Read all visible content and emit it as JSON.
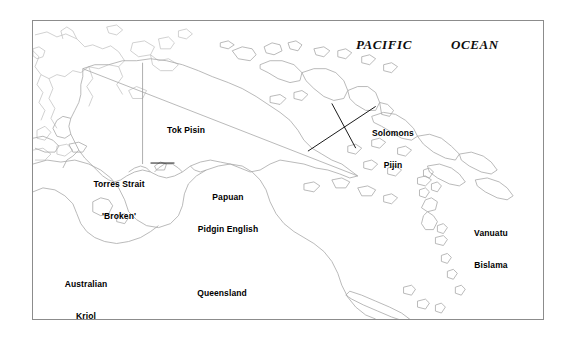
{
  "figure": {
    "kind": "reference-map",
    "frame_border_color": "#8c8c8c",
    "background_color": "#ffffff",
    "coastline_color": "#a8a8a8",
    "label_color": "#000000"
  },
  "ocean_labels": [
    {
      "id": "pacific",
      "text": "PACIFIC"
    },
    {
      "id": "ocean",
      "text": "OCEAN"
    }
  ],
  "language_labels": [
    {
      "id": "tok-pisin",
      "line1": "Tok Pisin",
      "line2": ""
    },
    {
      "id": "torres-strait-broken",
      "line1": "Torres Strait",
      "line2": "'Broken'"
    },
    {
      "id": "papuan-pidgin-english",
      "line1": "Papuan",
      "line2": "Pidgin English"
    },
    {
      "id": "solomons-pijin",
      "line1": "Solomons",
      "line2": "Pijin"
    },
    {
      "id": "vanuatu-bislama",
      "line1": "Vanuatu",
      "line2": "Bislama"
    },
    {
      "id": "australian-kriol",
      "line1": "Australian",
      "line2": "Kriol"
    },
    {
      "id": "queensland-canefields-english",
      "line1": "Queensland",
      "line2": "Canefields English"
    }
  ]
}
